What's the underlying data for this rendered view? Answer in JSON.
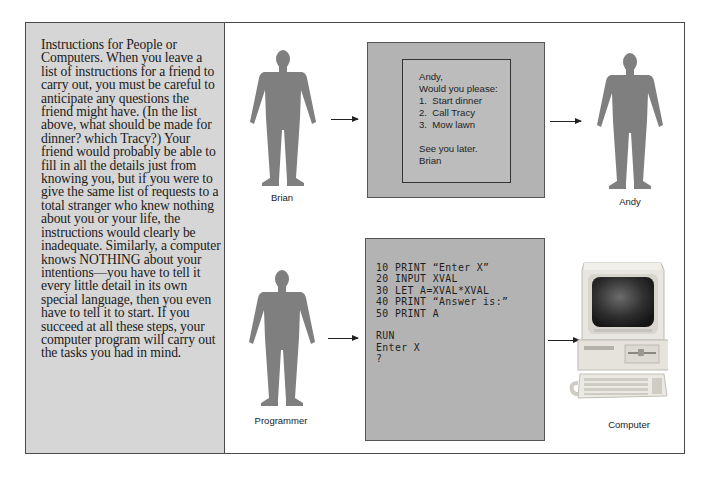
{
  "sidebar": {
    "text": "Instructions for People or Computers. When you leave a list of instructions for a friend to carry out, you must be careful to anticipate any questions the friend might have. (In the list above, what should be made for dinner? which Tracy?) Your friend would probably be able to fill in all the details just from knowing you, but if you were to give the same list of requests to a total stranger who knew nothing about you or your life, the instructions would clearly be inadequate. Similarly, a computer knows NOTHING about your intentions—you have to tell it every little detail in its own special language, then you even have to tell it to start. If you succeed at all these steps, your computer program will carry out the tasks you had in mind."
  },
  "people_row": {
    "sender_label": "Brian",
    "receiver_label": "Andy",
    "note": {
      "lines": [
        "Andy,",
        "Would you please:",
        "1.  Start dinner",
        "2.  Call Tracy",
        "3.  Mow lawn",
        "",
        "See you later.",
        "Brian"
      ]
    }
  },
  "computer_row": {
    "sender_label": "Programmer",
    "receiver_label": "Computer",
    "program": {
      "lines": [
        "10 PRINT “Enter X”",
        "20 INPUT XVAL",
        "30 LET A=XVAL*XVAL",
        "40 PRINT “Answer is:”",
        "50 PRINT A",
        "",
        "RUN",
        "Enter X",
        "?"
      ]
    }
  },
  "colors": {
    "silhouette": "#7f7f7f",
    "sidebar_bg": "#d6d6d6",
    "panel_bg": "#b3b3b3",
    "border": "#4a4a4a"
  }
}
